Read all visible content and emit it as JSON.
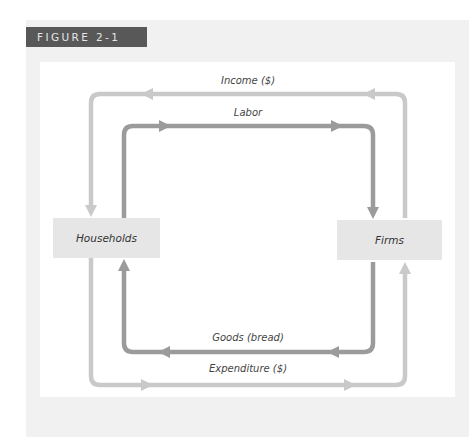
{
  "figure": {
    "label": "FIGURE 2-1"
  },
  "nodes": {
    "households": "Households",
    "firms": "Firms"
  },
  "flows": {
    "income": "Income ($)",
    "labor": "Labor",
    "goods": "Goods (bread)",
    "expenditure": "Expenditure ($)"
  },
  "colors": {
    "outer_loop": "#c9c9c9",
    "inner_loop": "#9b9b9b",
    "node_fill": "#e6e6e6",
    "label_bg": "#585858",
    "panel_bg": "#f1f1f1"
  }
}
